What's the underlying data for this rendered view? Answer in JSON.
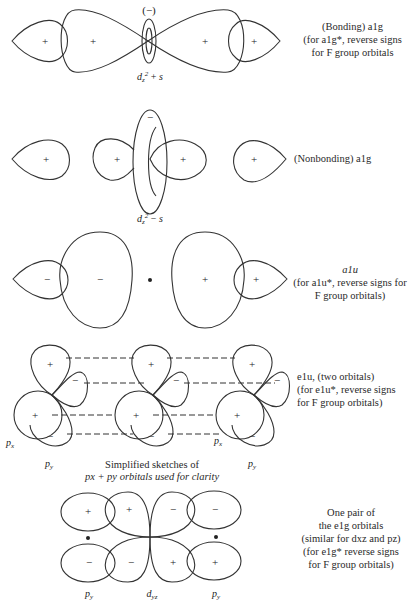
{
  "sections": [
    {
      "id": "a1g_bonding",
      "orbital_label": "d_z^2 + s",
      "torus_sign": "(−)",
      "lobe_signs": [
        "+",
        "+",
        "+",
        "+"
      ],
      "caption": [
        "(Bonding) a1g",
        "(for a1g*, reverse signs",
        "for F group orbitals"
      ]
    },
    {
      "id": "a1g_nonbonding",
      "orbital_label": "d_z^2 − s",
      "torus_sign": "−",
      "lobe_signs": [
        "+",
        "+",
        "+",
        "+"
      ],
      "caption": [
        "(Nonbonding) a1g"
      ]
    },
    {
      "id": "a1u",
      "lobe_signs": [
        "−",
        "−",
        "+",
        "+"
      ],
      "caption": [
        "a1u",
        "(for a1u*, reverse signs for",
        "F group orbitals)"
      ]
    },
    {
      "id": "e1u",
      "lobe_signs": [
        "+",
        "−",
        "+",
        "−"
      ],
      "labels": {
        "px": "px",
        "py": "py"
      },
      "sketch_caption": [
        "Simplified sketches of",
        "px + py orbitals used for clarity"
      ],
      "caption": [
        "e1u, (two orbitals)",
        "(for e1u*, reverse signs",
        "for F group orbitals)"
      ]
    },
    {
      "id": "e1g",
      "lobe_signs": [
        "+",
        "+",
        "−",
        "−",
        "−",
        "−",
        "+",
        "+"
      ],
      "labels": {
        "left": "py",
        "center": "dyz",
        "right": "py"
      },
      "caption": [
        "One pair of",
        "the e1g orbitals",
        "(similar for dxz and pz)",
        "(for e1g* reverse signs",
        "for F group orbitals)"
      ]
    }
  ]
}
